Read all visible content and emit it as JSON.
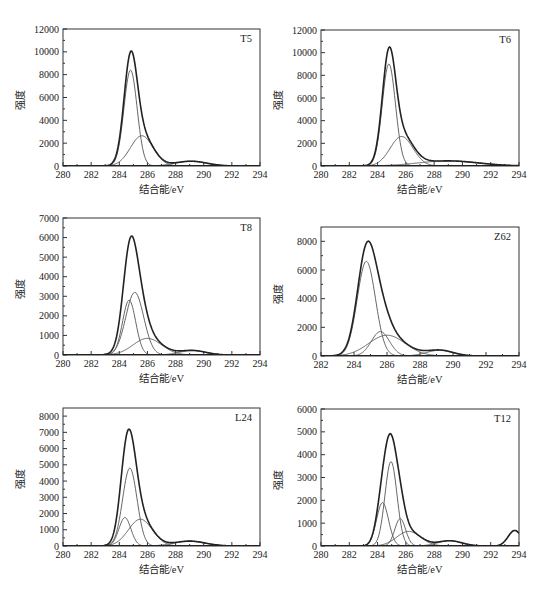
{
  "figure": {
    "xlabel": "结合能/eV",
    "ylabel": "强度"
  },
  "chart_data": [
    {
      "type": "line",
      "title": "T5",
      "xlabel": "结合能/eV",
      "ylabel": "强度",
      "xlim": [
        280,
        294
      ],
      "ylim": [
        0,
        12000
      ],
      "xticks": [
        280,
        282,
        284,
        286,
        288,
        290,
        292,
        294
      ],
      "yticks": [
        0,
        2000,
        4000,
        6000,
        8000,
        10000,
        12000
      ],
      "grid": false,
      "frame": {
        "left": 63,
        "top": 29,
        "right": 260,
        "bottom": 166
      },
      "components": [
        {
          "center": 284.8,
          "height": 8400,
          "fwhm": 1.1
        },
        {
          "center": 285.6,
          "height": 2650,
          "fwhm": 1.9
        },
        {
          "center": 289.1,
          "height": 420,
          "fwhm": 2.6
        }
      ],
      "envelope_peak": {
        "x": 284.8,
        "y": 10400
      }
    },
    {
      "type": "line",
      "title": "T6",
      "xlabel": "结合能/eV",
      "ylabel": "强度",
      "xlim": [
        280,
        294
      ],
      "ylim": [
        0,
        12000
      ],
      "xticks": [
        280,
        282,
        284,
        286,
        288,
        290,
        292,
        294
      ],
      "yticks": [
        0,
        2000,
        4000,
        6000,
        8000,
        10000,
        12000
      ],
      "grid": false,
      "frame": {
        "left": 321,
        "top": 30,
        "right": 519,
        "bottom": 166
      },
      "components": [
        {
          "center": 284.8,
          "height": 9000,
          "fwhm": 1.1
        },
        {
          "center": 285.7,
          "height": 2600,
          "fwhm": 1.9
        },
        {
          "center": 289.0,
          "height": 450,
          "fwhm": 5.0
        }
      ],
      "envelope_peak": {
        "x": 284.9,
        "y": 10800
      }
    },
    {
      "type": "line",
      "title": "T8",
      "xlabel": "结合能/eV",
      "ylabel": "强度",
      "xlim": [
        280,
        294
      ],
      "ylim": [
        0,
        7000
      ],
      "xticks": [
        280,
        282,
        284,
        286,
        288,
        290,
        292,
        294
      ],
      "yticks": [
        0,
        1000,
        2000,
        3000,
        4000,
        5000,
        6000,
        7000
      ],
      "grid": false,
      "frame": {
        "left": 63,
        "top": 218,
        "right": 260,
        "bottom": 355
      },
      "components": [
        {
          "center": 284.7,
          "height": 2800,
          "fwhm": 1.1
        },
        {
          "center": 285.1,
          "height": 3200,
          "fwhm": 1.5
        },
        {
          "center": 286.0,
          "height": 850,
          "fwhm": 2.4
        },
        {
          "center": 289.2,
          "height": 230,
          "fwhm": 2.2
        }
      ],
      "envelope_peak": {
        "x": 284.8,
        "y": 6200
      }
    },
    {
      "type": "line",
      "title": "Z62",
      "xlabel": "结合能/eV",
      "ylabel": "强度",
      "xlim": [
        282,
        294
      ],
      "ylim": [
        0,
        9000
      ],
      "xticks": [
        282,
        284,
        286,
        288,
        290,
        292,
        294
      ],
      "yticks": [
        0,
        2000,
        4000,
        6000,
        8000
      ],
      "grid": false,
      "frame": {
        "left": 321,
        "top": 227,
        "right": 519,
        "bottom": 356
      },
      "components": [
        {
          "center": 284.75,
          "height": 6600,
          "fwhm": 1.3
        },
        {
          "center": 285.6,
          "height": 1700,
          "fwhm": 1.3
        },
        {
          "center": 286.0,
          "height": 1450,
          "fwhm": 2.6
        },
        {
          "center": 289.2,
          "height": 400,
          "fwhm": 1.9
        }
      ],
      "envelope_peak": {
        "x": 284.85,
        "y": 8000
      }
    },
    {
      "type": "line",
      "title": "L24",
      "xlabel": "结合能/eV",
      "ylabel": "强度",
      "xlim": [
        280,
        294
      ],
      "ylim": [
        0,
        8500
      ],
      "xticks": [
        280,
        282,
        284,
        286,
        288,
        290,
        292,
        294
      ],
      "yticks": [
        0,
        1000,
        2000,
        3000,
        4000,
        5000,
        6000,
        7000,
        8000
      ],
      "grid": false,
      "frame": {
        "left": 63,
        "top": 408,
        "right": 260,
        "bottom": 546
      },
      "components": [
        {
          "center": 284.4,
          "height": 1750,
          "fwhm": 1.0
        },
        {
          "center": 284.75,
          "height": 4800,
          "fwhm": 1.2
        },
        {
          "center": 285.5,
          "height": 1650,
          "fwhm": 2.0
        },
        {
          "center": 289.0,
          "height": 300,
          "fwhm": 2.6
        }
      ],
      "envelope_peak": {
        "x": 284.7,
        "y": 7500
      }
    },
    {
      "type": "line",
      "title": "T12",
      "xlabel": "结合能/eV",
      "ylabel": "强度",
      "xlim": [
        280,
        294
      ],
      "ylim": [
        0,
        6000
      ],
      "xticks": [
        280,
        282,
        284,
        286,
        288,
        290,
        292,
        294
      ],
      "yticks": [
        0,
        1000,
        2000,
        3000,
        4000,
        5000,
        6000
      ],
      "grid": false,
      "frame": {
        "left": 321,
        "top": 409,
        "right": 519,
        "bottom": 546
      },
      "components": [
        {
          "center": 284.35,
          "height": 1900,
          "fwhm": 1.0
        },
        {
          "center": 284.95,
          "height": 3700,
          "fwhm": 1.0
        },
        {
          "center": 285.6,
          "height": 1200,
          "fwhm": 0.9
        },
        {
          "center": 286.2,
          "height": 640,
          "fwhm": 2.0
        },
        {
          "center": 289.1,
          "height": 230,
          "fwhm": 2.0
        },
        {
          "center": 293.7,
          "height": 680,
          "fwhm": 1.1
        }
      ],
      "envelope_peak": {
        "x": 284.85,
        "y": 5150
      }
    }
  ]
}
